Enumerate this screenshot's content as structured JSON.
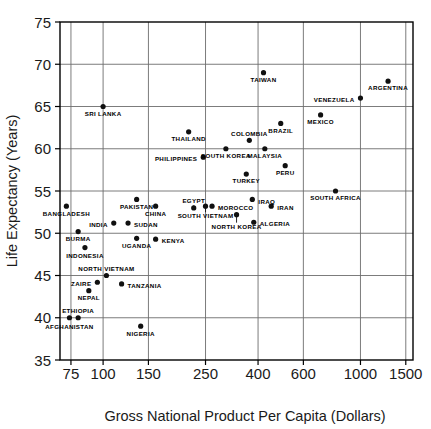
{
  "chart_data": {
    "type": "scatter",
    "title": "",
    "xlabel": "Gross National Product Per Capita (Dollars)",
    "ylabel": "Life Expectancy (Years)",
    "xscale": "log",
    "yscale": "linear",
    "xlim": [
      68,
      1600
    ],
    "ylim": [
      35,
      75
    ],
    "xticks": [
      75,
      100,
      150,
      250,
      400,
      600,
      1000,
      1500
    ],
    "xtick_labels": [
      "75",
      "100",
      "150",
      "250",
      "400",
      "600",
      "1000",
      "1500"
    ],
    "yticks": [
      35,
      40,
      45,
      50,
      55,
      60,
      65,
      70,
      75
    ],
    "ytick_labels": [
      "35",
      "40",
      "45",
      "50",
      "55",
      "60",
      "65",
      "70",
      "75"
    ],
    "grid": true,
    "legend": "none",
    "marker": "filled-circle",
    "marker_color": "#101010",
    "points": [
      {
        "label": "SRI LANKA",
        "x": 100,
        "y": 65.0,
        "lx": 0,
        "ly": 7,
        "anchor": "middle"
      },
      {
        "label": "TAIWAN",
        "x": 420,
        "y": 69.0,
        "lx": 0,
        "ly": 7,
        "anchor": "middle"
      },
      {
        "label": "ARGENTINA",
        "x": 1280,
        "y": 68.0,
        "lx": 0,
        "ly": 7,
        "anchor": "middle"
      },
      {
        "label": "VENEZUELA",
        "x": 1000,
        "y": 66.0,
        "lx": -6,
        "ly": 2,
        "anchor": "end"
      },
      {
        "label": "MEXICO",
        "x": 700,
        "y": 64.0,
        "lx": 0,
        "ly": 7,
        "anchor": "middle"
      },
      {
        "label": "BRAZIL",
        "x": 490,
        "y": 63.0,
        "lx": 0,
        "ly": 7,
        "anchor": "middle"
      },
      {
        "label": "THAILAND",
        "x": 215,
        "y": 62.0,
        "lx": 0,
        "ly": 7,
        "anchor": "middle"
      },
      {
        "label": "COLOMBIA",
        "x": 370,
        "y": 61.0,
        "lx": 0,
        "ly": -4,
        "anchor": "middle"
      },
      {
        "label": "SOUTH KOREA",
        "x": 300,
        "y": 60.0,
        "lx": 0,
        "ly": 7,
        "anchor": "middle"
      },
      {
        "label": "MALAYSIA",
        "x": 425,
        "y": 60.0,
        "lx": 0,
        "ly": 7,
        "anchor": "middle"
      },
      {
        "label": "PHILIPPINES",
        "x": 245,
        "y": 59.0,
        "lx": -6,
        "ly": 2,
        "anchor": "end"
      },
      {
        "label": "PERU",
        "x": 510,
        "y": 58.0,
        "lx": 0,
        "ly": 7,
        "anchor": "middle"
      },
      {
        "label": "TURKEY",
        "x": 360,
        "y": 57.0,
        "lx": 0,
        "ly": 7,
        "anchor": "middle"
      },
      {
        "label": "SOUTH AFRICA",
        "x": 800,
        "y": 55.0,
        "lx": 0,
        "ly": 7,
        "anchor": "middle"
      },
      {
        "label": "PAKISTAN",
        "x": 135,
        "y": 54.0,
        "lx": 0,
        "ly": 7,
        "anchor": "middle"
      },
      {
        "label": "IRAQ",
        "x": 380,
        "y": 54.0,
        "lx": 6,
        "ly": 2,
        "anchor": "start"
      },
      {
        "label": "BANGLADESH",
        "x": 72,
        "y": 53.2,
        "lx": 0,
        "ly": 8,
        "anchor": "middle"
      },
      {
        "label": "CHINA",
        "x": 160,
        "y": 53.2,
        "lx": 0,
        "ly": 8,
        "anchor": "middle"
      },
      {
        "label": "EGYPT",
        "x": 225,
        "y": 53.0,
        "lx": 0,
        "ly": -4,
        "anchor": "middle"
      },
      {
        "label": "MOROCCO",
        "x": 265,
        "y": 53.2,
        "lx": 6,
        "ly": 2,
        "anchor": "start"
      },
      {
        "label": "IRAN",
        "x": 450,
        "y": 53.2,
        "lx": 6,
        "ly": 2,
        "anchor": "start"
      },
      {
        "label": "SOUTH VIETNAM",
        "x": 250,
        "y": 53.2,
        "lx": 0,
        "ly": 10,
        "anchor": "middle"
      },
      {
        "label": "NORTH KOREA",
        "x": 330,
        "y": 52.2,
        "lx": 0,
        "ly": 12,
        "anchor": "middle"
      },
      {
        "label": "ALGERIA",
        "x": 385,
        "y": 51.3,
        "lx": 6,
        "ly": 2,
        "anchor": "start"
      },
      {
        "label": "INDIA",
        "x": 110,
        "y": 51.2,
        "lx": -6,
        "ly": 2,
        "anchor": "end"
      },
      {
        "label": "SUDAN",
        "x": 125,
        "y": 51.2,
        "lx": 6,
        "ly": 2,
        "anchor": "start"
      },
      {
        "label": "BURMA",
        "x": 80,
        "y": 50.2,
        "lx": 0,
        "ly": 7,
        "anchor": "middle"
      },
      {
        "label": "UGANDA",
        "x": 135,
        "y": 49.4,
        "lx": 0,
        "ly": 7,
        "anchor": "middle"
      },
      {
        "label": "KENYA",
        "x": 160,
        "y": 49.3,
        "lx": 6,
        "ly": 2,
        "anchor": "start"
      },
      {
        "label": "INDONESIA",
        "x": 85,
        "y": 48.3,
        "lx": 0,
        "ly": 8,
        "anchor": "middle"
      },
      {
        "label": "NORTH VIETNAM",
        "x": 103,
        "y": 45.0,
        "lx": 0,
        "ly": -4,
        "anchor": "middle"
      },
      {
        "label": "ZAIRE",
        "x": 95,
        "y": 44.2,
        "lx": -6,
        "ly": 2,
        "anchor": "end"
      },
      {
        "label": "TANZANIA",
        "x": 118,
        "y": 44.0,
        "lx": 6,
        "ly": 2,
        "anchor": "start"
      },
      {
        "label": "NEPAL",
        "x": 88,
        "y": 43.2,
        "lx": 0,
        "ly": 7,
        "anchor": "middle"
      },
      {
        "label": "ETHIOPIA",
        "x": 80,
        "y": 40.0,
        "lx": 0,
        "ly": -4,
        "anchor": "middle"
      },
      {
        "label": "AFGHANISTAN",
        "x": 74,
        "y": 40.0,
        "lx": 0,
        "ly": 9,
        "anchor": "middle"
      },
      {
        "label": "NIGERIA",
        "x": 140,
        "y": 39.0,
        "lx": 0,
        "ly": 8,
        "anchor": "middle"
      }
    ],
    "leaders": [
      {
        "from_label": "EGYPT",
        "x": 225,
        "y": 53.0
      },
      {
        "from_label": "SOUTH VIETNAM",
        "x": 250,
        "y": 53.2
      },
      {
        "from_label": "NORTH KOREA",
        "x": 330,
        "y": 52.2
      }
    ]
  }
}
